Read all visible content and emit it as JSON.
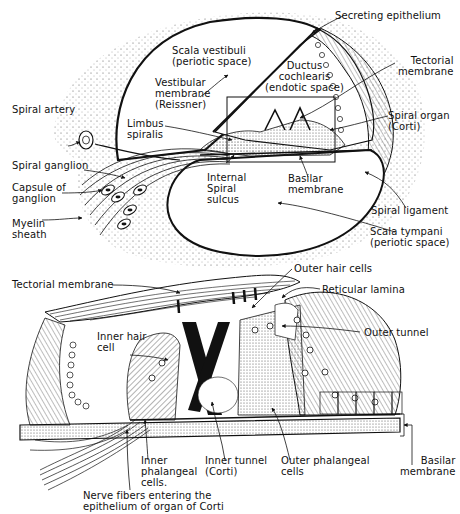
{
  "top_diagram": {
    "title": "Cross section of cochlear duct",
    "labels": {
      "secreting_epithelium": "Secreting epithelium",
      "scala_vestibuli": "Scala vestibuli\n(periotic space)",
      "tectorial_membrane": "Tectorial\nmembrane",
      "ductus_cochlearis": "Ductus\ncochlearis\n(endotic space)",
      "vestibular_membrane": "Vestibular\nmembrane\n(Reissner)",
      "spiral_artery": "Spiral artery",
      "spiral_organ": "Spiral organ\n(Corti)",
      "limbus_spiralis": "Limbus\nspiralis",
      "spiral_ganglion": "Spiral ganglion",
      "capsule_of_ganglion": "Capsule of\nganglion",
      "internal_spiral_sulcus": "Internal\nSpiral\nsulcus",
      "basilar_membrane": "Basilar\nmembrane",
      "spiral_ligament": "Spiral ligament",
      "myelin_sheath": "Myelin\nsheath",
      "scala_tympani": "Scala tympani\n(periotic space)"
    }
  },
  "bottom_diagram": {
    "title": "Organ of Corti (enlarged)",
    "labels": {
      "tectorial_membrane": "Tectorial membrane",
      "outer_hair_cells": "Outer hair cells",
      "reticular_lamina": "Reticular lamina",
      "inner_hair_cell": "Inner hair\ncell",
      "outer_tunnel": "Outer tunnel",
      "inner_phalangeal_cells": "Inner\nphalangeal\ncells.",
      "inner_tunnel": "Inner tunnel\n(Corti)",
      "outer_phalangeal_cells": "Outer phalangeal\ncells",
      "basilar_membrane": "Basilar\nmembrane",
      "nerve_fibers": "Nerve fibers entering the\nepithelium of organ of Corti"
    }
  },
  "colors": {
    "ink": "#111111",
    "paper": "#ffffff",
    "stipple": "#555555"
  }
}
